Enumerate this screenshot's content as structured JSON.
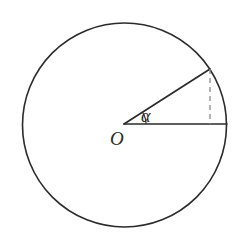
{
  "figure": {
    "background_color": "#ffffff",
    "stroke_color": "#2b2b2b",
    "dashed_color": "#8c8c8c",
    "labels": {
      "center_point": "O",
      "angle": "α"
    },
    "geometry": {
      "canvas_width": 246,
      "canvas_height": 249,
      "circle": {
        "center_x": 124.5,
        "center_y": 125,
        "radius": 102,
        "stroke_width": 1.6
      },
      "center_point": {
        "x": 124,
        "y": 124
      },
      "horizontal_radius_end": {
        "x": 227,
        "y": 124
      },
      "slanted_radius_end": {
        "x": 210,
        "y": 69
      },
      "dashed_segment": {
        "x1": 210,
        "y1": 69,
        "x2": 210,
        "y2": 124,
        "dash_pattern": "5 4",
        "stroke_width": 1.3
      },
      "angle_arc": {
        "radius": 22,
        "degrees": 32.6,
        "start_x": 146,
        "start_y": 124,
        "end_x": 142.5,
        "end_y": 112.2
      },
      "label_positions": {
        "center_point": {
          "x": 110,
          "y": 145
        },
        "angle": {
          "x": 141,
          "y": 122
        }
      }
    }
  }
}
